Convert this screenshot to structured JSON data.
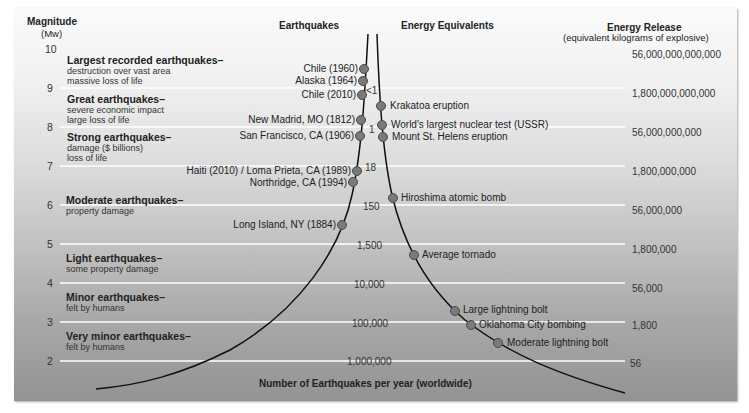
{
  "headers": {
    "magnitude": "Magnitude",
    "magnitude_unit": "(Mw)",
    "earthquakes": "Earthquakes",
    "energy_equivalents": "Energy Equivalents",
    "energy_release": "Energy Release",
    "energy_release_unit": "(equivalent kilograms of explosive)",
    "x_axis": "Number of Earthquakes per year (worldwide)"
  },
  "magnitudes": [
    "10",
    "9",
    "8",
    "7",
    "6",
    "5",
    "4",
    "3",
    "2"
  ],
  "categories": [
    {
      "title": "Largest recorded earthquakes–",
      "desc": [
        "destruction over vast area",
        "massive loss of life"
      ]
    },
    {
      "title": "Great earthquakes–",
      "desc": [
        "severe economic impact",
        "large loss of life"
      ]
    },
    {
      "title": "Strong earthquakes–",
      "desc": [
        "damage ($ billions)",
        "loss of life"
      ]
    },
    {
      "title": "Moderate earthquakes–",
      "desc": [
        "property damage"
      ]
    },
    {
      "title": "Light earthquakes–",
      "desc": [
        "some property damage"
      ]
    },
    {
      "title": "Minor earthquakes–",
      "desc": [
        "felt by humans"
      ]
    },
    {
      "title": "Very minor earthquakes–",
      "desc": [
        "felt by humans"
      ]
    }
  ],
  "earthquakes": [
    {
      "label": "Chile (1960)"
    },
    {
      "label": "Alaska (1964)"
    },
    {
      "label": "Chile (2010)"
    },
    {
      "label": "New Madrid, MO (1812)"
    },
    {
      "label": "San Francisco, CA (1906)"
    },
    {
      "label": "Haiti (2010) / Loma Prieta, CA (1989)"
    },
    {
      "label": "Northridge, CA (1994)"
    },
    {
      "label": "Long Island, NY (1884)"
    }
  ],
  "counts": [
    "<1",
    "1",
    "18",
    "150",
    "1,500",
    "10,000",
    "100,000",
    "1,000,000"
  ],
  "equivalents": [
    {
      "label": "Krakatoa eruption"
    },
    {
      "label": "World's largest nuclear test (USSR)"
    },
    {
      "label": "Mount St. Helens eruption"
    },
    {
      "label": "Hiroshima atomic bomb"
    },
    {
      "label": "Average tornado"
    },
    {
      "label": "Large lightning bolt"
    },
    {
      "label": "Oklahoma City bombing"
    },
    {
      "label": "Moderate lightning bolt"
    }
  ],
  "energy": [
    "56,000,000,000,000",
    "1,800,000,000,000",
    "56,000,000,000",
    "1,800,000,000",
    "56,000,000",
    "1,800,000",
    "56,000",
    "1,800",
    "56"
  ],
  "colors": {
    "point_fill": "#7a7a7a",
    "point_stroke": "#4a4a4a",
    "curve": "#111111",
    "gridline": "#ffffff"
  }
}
